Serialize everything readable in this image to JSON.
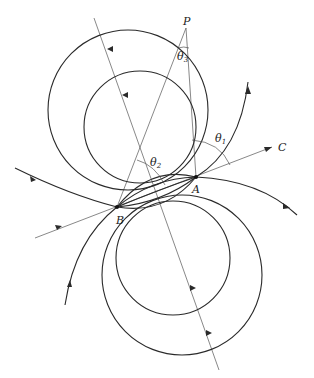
{
  "figure": {
    "points": {
      "A": {
        "label": "A",
        "x": 196,
        "y": 177
      },
      "B": {
        "label": "B",
        "x": 117,
        "y": 207
      },
      "P": {
        "label": "P",
        "x": 186,
        "y": 20
      },
      "C": {
        "label": "C",
        "x": 281,
        "y": 147
      }
    },
    "angles": {
      "theta1": {
        "symbol": "θ",
        "sub": "1"
      },
      "theta2": {
        "symbol": "θ",
        "sub": "2"
      },
      "theta3": {
        "symbol": "θ",
        "sub": "3"
      }
    },
    "colors": {
      "line": "#2a2a2a",
      "construction": "#555555",
      "background": "#ffffff"
    }
  }
}
